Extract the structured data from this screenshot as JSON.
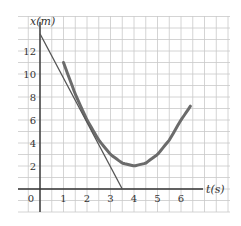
{
  "chart_data": {
    "type": "line",
    "title": "",
    "xlabel": "t(s)",
    "ylabel": "x(m)",
    "xlim": [
      -1.2,
      8.0
    ],
    "ylim": [
      -2.5,
      15.0
    ],
    "x_ticks": [
      0,
      1,
      2,
      3,
      4,
      5,
      6
    ],
    "x_tick_labels": [
      "0",
      "1",
      "2",
      "3",
      "4",
      "5",
      "6"
    ],
    "y_ticks": [
      2,
      4,
      6,
      8,
      10,
      12
    ],
    "y_tick_labels": [
      "2",
      "4",
      "6",
      "8",
      "10",
      "12"
    ],
    "grid": true,
    "grid_minor_step_x": 0.5,
    "grid_minor_step_y": 1,
    "series": [
      {
        "name": "position curve",
        "kind": "curve",
        "color": "#6b6b6b",
        "width": 3,
        "x": [
          1.0,
          1.5,
          2.0,
          2.5,
          3.0,
          3.5,
          4.0,
          4.5,
          5.0,
          5.5,
          6.0,
          6.4
        ],
        "values": [
          11.0,
          8.25,
          6.0,
          4.25,
          3.0,
          2.25,
          2.0,
          2.25,
          3.0,
          4.25,
          6.0,
          7.2
        ]
      },
      {
        "name": "tangent line at t=2s",
        "kind": "line",
        "color": "#555555",
        "width": 1.3,
        "x": [
          0.0,
          3.5
        ],
        "values": [
          13.5,
          0.0
        ]
      }
    ],
    "annotations": []
  },
  "layout": {
    "origin_px": [
      40,
      189
    ],
    "px_per_unit_x": 23.5,
    "px_per_unit_y": 11.5,
    "grid_box_px": [
      18,
      16,
      230,
      212
    ]
  }
}
